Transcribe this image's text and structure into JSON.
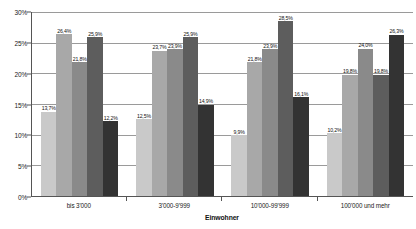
{
  "chart_data": {
    "type": "bar",
    "title": "",
    "xlabel": "Einwohner",
    "ylabel": "",
    "ylim": [
      0,
      30
    ],
    "ytick_labels": [
      "0%",
      "5%",
      "10%",
      "15%",
      "20%",
      "25%",
      "30%"
    ],
    "ytick_values": [
      0,
      5,
      10,
      15,
      20,
      25,
      30
    ],
    "grid": true,
    "legend": "none",
    "value_suffix": "%",
    "categories": [
      "bis 3'000",
      "3'000-9'999",
      "10'000-99'999",
      "100'000 und mehr"
    ],
    "series": [
      {
        "name": "series-1",
        "color": "#c9c9c9",
        "values": [
          13.7,
          12.5,
          9.9,
          10.2
        ],
        "labels": [
          "13,7%",
          "12,5%",
          "9,9%",
          "10,2%"
        ]
      },
      {
        "name": "series-2",
        "color": "#a8a8a8",
        "values": [
          26.4,
          23.7,
          21.8,
          19.8
        ],
        "labels": [
          "26,4%",
          "23,7%",
          "21,8%",
          "19,8%"
        ]
      },
      {
        "name": "series-3",
        "color": "#8a8a8a",
        "values": [
          21.8,
          23.9,
          23.9,
          24.0
        ],
        "labels": [
          "21,8%",
          "23,9%",
          "23,9%",
          "24,0%"
        ]
      },
      {
        "name": "series-4",
        "color": "#5d5d5d",
        "values": [
          25.9,
          25.9,
          28.5,
          19.8
        ],
        "labels": [
          "25,9%",
          "25,9%",
          "28,5%",
          "19,8%"
        ]
      },
      {
        "name": "series-5",
        "color": "#333333",
        "values": [
          12.2,
          14.9,
          16.1,
          26.3
        ],
        "labels": [
          "12,2%",
          "14,9%",
          "16,1%",
          "26,3%"
        ]
      }
    ]
  }
}
